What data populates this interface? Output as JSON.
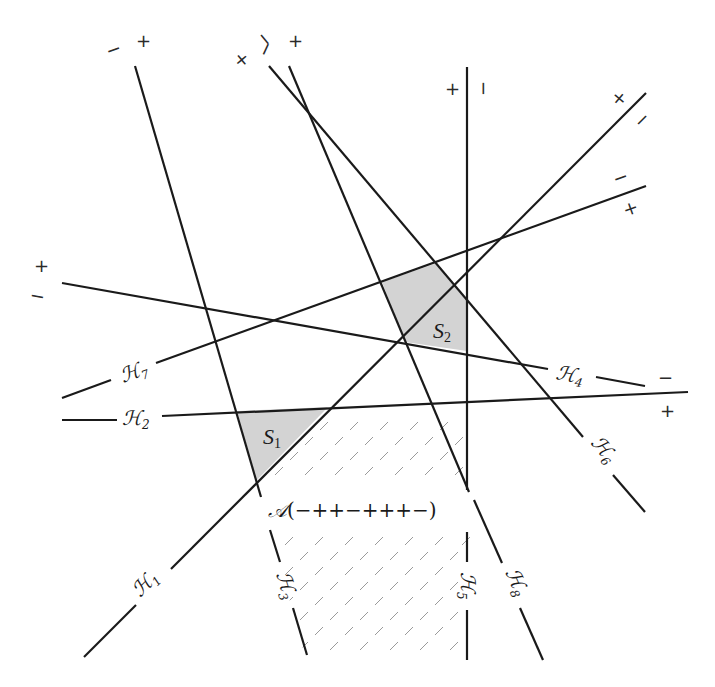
{
  "diagram": {
    "colors": {
      "line": "#1a1a1a",
      "shade": "#d3d3d3",
      "hatch": "#9a9a9a"
    },
    "hyperplanes": [
      {
        "id": "H1",
        "symbol": "ℋ",
        "subscript": "1",
        "plus_sign": "+",
        "minus_sign": "−"
      },
      {
        "id": "H2",
        "symbol": "ℋ",
        "subscript": "2",
        "plus_sign": "+",
        "minus_sign": ""
      },
      {
        "id": "H3",
        "symbol": "ℋ",
        "subscript": "3",
        "plus_sign": "+",
        "minus_sign": "−"
      },
      {
        "id": "H4",
        "symbol": "ℋ",
        "subscript": "4",
        "plus_sign": "+",
        "minus_sign": "−"
      },
      {
        "id": "H5",
        "symbol": "ℋ",
        "subscript": "5",
        "plus_sign": "+",
        "minus_sign": "−"
      },
      {
        "id": "H6",
        "symbol": "ℋ",
        "subscript": "6",
        "plus_sign": "+",
        "minus_sign": "−"
      },
      {
        "id": "H7",
        "symbol": "ℋ",
        "subscript": "7",
        "plus_sign": "+",
        "minus_sign": "−"
      },
      {
        "id": "H8",
        "symbol": "ℋ",
        "subscript": "8",
        "plus_sign": "+",
        "minus_sign": "−"
      }
    ],
    "regions": [
      {
        "id": "S1",
        "letter": "S",
        "subscript": "1",
        "shaded": true
      },
      {
        "id": "S2",
        "letter": "S",
        "subscript": "2",
        "shaded": true
      }
    ],
    "cell_label": {
      "symbol": "𝒜",
      "sign_vector": "(−++−+++−)"
    },
    "signs": {
      "plus": "+",
      "minus": "−"
    }
  }
}
